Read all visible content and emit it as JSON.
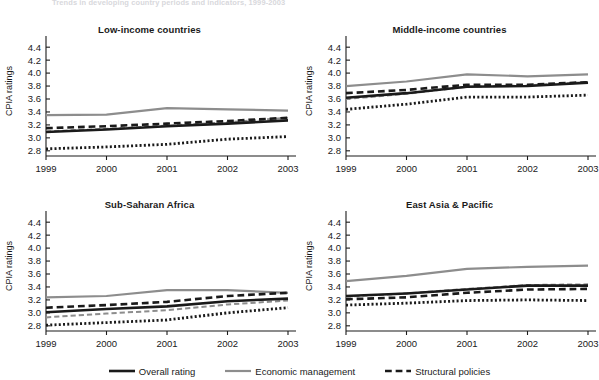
{
  "figure": {
    "suptitle": "Trends in developing country periods and indicators, 1999-2003",
    "ylabel": "CPIA ratings"
  },
  "legend": {
    "position": "bottom-center",
    "items": [
      {
        "label": "Overall rating",
        "style": "solid",
        "color": "#1a1a1a",
        "width": 2.6
      },
      {
        "label": "Economic management",
        "style": "solid",
        "color": "#8d8d8d",
        "width": 2.2
      },
      {
        "label": "Structural policies",
        "style": "dashed",
        "color": "#1a1a1a",
        "width": 2.6
      }
    ]
  },
  "axes": {
    "ylim": [
      2.72,
      4.48
    ],
    "yticks": [
      "2.8",
      "3.0",
      "3.2",
      "3.4",
      "3.6",
      "3.8",
      "4.0",
      "4.2",
      "4.4"
    ],
    "ytick_values": [
      2.8,
      3.0,
      3.2,
      3.4,
      3.6,
      3.8,
      4.0,
      4.2,
      4.4
    ],
    "xticks": [
      "1999",
      "2000",
      "2001",
      "2002",
      "2003"
    ],
    "xtick_values": [
      1999,
      2000,
      2001,
      2002,
      2003
    ],
    "grid": false
  },
  "chart_data": [
    {
      "type": "line",
      "title": "Low-income countries",
      "xlabel": "",
      "ylabel": "CPIA ratings",
      "x": [
        1999,
        2000,
        2001,
        2002,
        2003
      ],
      "ylim": [
        2.72,
        4.48
      ],
      "series": [
        {
          "name": "Economic management",
          "style": "solid",
          "color": "#8d8d8d",
          "width": 2.2,
          "values": [
            3.35,
            3.36,
            3.46,
            3.44,
            3.42
          ]
        },
        {
          "name": "Structural policies",
          "style": "dashed",
          "color": "#1a1a1a",
          "width": 2.6,
          "values": [
            3.15,
            3.18,
            3.22,
            3.26,
            3.31
          ]
        },
        {
          "name": "Overall rating",
          "style": "solid",
          "color": "#1a1a1a",
          "width": 2.6,
          "values": [
            3.09,
            3.13,
            3.18,
            3.22,
            3.27
          ]
        },
        {
          "name": "Public sector management",
          "style": "dashed",
          "color": "#8d8d8d",
          "width": 2.0,
          "values": [
            3.1,
            3.14,
            3.19,
            3.24,
            3.31
          ]
        },
        {
          "name": "Social inclusion",
          "style": "dotted",
          "color": "#1a1a1a",
          "width": 2.8,
          "values": [
            2.83,
            2.86,
            2.9,
            2.98,
            3.02
          ]
        }
      ]
    },
    {
      "type": "line",
      "title": "Middle-income countries",
      "xlabel": "",
      "ylabel": "CPIA ratings",
      "x": [
        1999,
        2000,
        2001,
        2002,
        2003
      ],
      "ylim": [
        2.72,
        4.48
      ],
      "series": [
        {
          "name": "Economic management",
          "style": "solid",
          "color": "#8d8d8d",
          "width": 2.2,
          "values": [
            3.8,
            3.87,
            3.98,
            3.95,
            3.98
          ]
        },
        {
          "name": "Structural policies",
          "style": "dashed",
          "color": "#1a1a1a",
          "width": 2.6,
          "values": [
            3.69,
            3.74,
            3.82,
            3.82,
            3.86
          ]
        },
        {
          "name": "Overall rating",
          "style": "solid",
          "color": "#1a1a1a",
          "width": 2.6,
          "values": [
            3.62,
            3.69,
            3.79,
            3.8,
            3.85
          ]
        },
        {
          "name": "Public sector management",
          "style": "dashed",
          "color": "#8d8d8d",
          "width": 2.0,
          "values": [
            3.6,
            3.68,
            3.79,
            3.81,
            3.86
          ]
        },
        {
          "name": "Social inclusion",
          "style": "dotted",
          "color": "#1a1a1a",
          "width": 2.8,
          "values": [
            3.44,
            3.52,
            3.63,
            3.63,
            3.66
          ]
        }
      ]
    },
    {
      "type": "line",
      "title": "Sub-Saharan Africa",
      "xlabel": "",
      "ylabel": "CPIA ratings",
      "x": [
        1999,
        2000,
        2001,
        2002,
        2003
      ],
      "ylim": [
        2.72,
        4.48
      ],
      "series": [
        {
          "name": "Economic management",
          "style": "solid",
          "color": "#8d8d8d",
          "width": 2.2,
          "values": [
            3.24,
            3.26,
            3.35,
            3.35,
            3.31
          ]
        },
        {
          "name": "Structural policies",
          "style": "dashed",
          "color": "#1a1a1a",
          "width": 2.6,
          "values": [
            3.08,
            3.12,
            3.17,
            3.26,
            3.31
          ]
        },
        {
          "name": "Overall rating",
          "style": "solid",
          "color": "#1a1a1a",
          "width": 2.6,
          "values": [
            3.01,
            3.06,
            3.1,
            3.18,
            3.22
          ]
        },
        {
          "name": "Public sector management",
          "style": "dashed",
          "color": "#8d8d8d",
          "width": 2.0,
          "values": [
            2.93,
            2.99,
            3.04,
            3.13,
            3.19
          ]
        },
        {
          "name": "Social inclusion",
          "style": "dotted",
          "color": "#1a1a1a",
          "width": 2.8,
          "values": [
            2.81,
            2.85,
            2.89,
            3.0,
            3.08
          ]
        }
      ]
    },
    {
      "type": "line",
      "title": "East Asia & Pacific",
      "xlabel": "",
      "ylabel": "CPIA ratings",
      "x": [
        1999,
        2000,
        2001,
        2002,
        2003
      ],
      "ylim": [
        2.72,
        4.48
      ],
      "series": [
        {
          "name": "Economic management",
          "style": "solid",
          "color": "#8d8d8d",
          "width": 2.2,
          "values": [
            3.49,
            3.57,
            3.68,
            3.71,
            3.73
          ]
        },
        {
          "name": "Structural policies",
          "style": "dashed",
          "color": "#1a1a1a",
          "width": 2.6,
          "values": [
            3.21,
            3.24,
            3.31,
            3.36,
            3.37
          ]
        },
        {
          "name": "Overall rating",
          "style": "solid",
          "color": "#1a1a1a",
          "width": 2.6,
          "values": [
            3.26,
            3.3,
            3.36,
            3.42,
            3.42
          ]
        },
        {
          "name": "Public sector management",
          "style": "dashed",
          "color": "#8d8d8d",
          "width": 2.0,
          "values": [
            3.25,
            3.3,
            3.37,
            3.43,
            3.44
          ]
        },
        {
          "name": "Social inclusion",
          "style": "dotted",
          "color": "#1a1a1a",
          "width": 2.8,
          "values": [
            3.12,
            3.15,
            3.19,
            3.2,
            3.19
          ]
        }
      ]
    }
  ]
}
